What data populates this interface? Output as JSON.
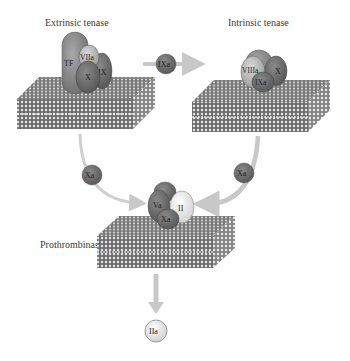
{
  "diagram": {
    "complexes": [
      {
        "id": "extrinsic",
        "label": "Extrinsic tenase",
        "factors": [
          "TF",
          "VIIa",
          "X",
          "IX"
        ]
      },
      {
        "id": "intrinsic",
        "label": "Intrinsic tenase",
        "factors": [
          "VIIIa",
          "X",
          "IXa"
        ]
      },
      {
        "id": "prothrombinase",
        "label": "Prothrombinase",
        "factors": [
          "Va",
          "Xa",
          "II"
        ]
      }
    ],
    "free_molecules": {
      "ixa": "IXa",
      "xa_left": "Xa",
      "xa_right": "Xa",
      "iia": "IIa"
    },
    "factor_labels": {
      "tf": "TF",
      "viia": "VIIa",
      "x_ext": "X",
      "ix": "IX",
      "viiia": "VIIIa",
      "x_int": "X",
      "ixa_int": "IXa",
      "va": "Va",
      "xa_pro": "Xa",
      "ii": "II"
    },
    "colors": {
      "dark_protein": "#6a6a6a",
      "mid_protein": "#8c8c8c",
      "light_protein": "#bdbdbd",
      "white_protein": "#f2f2f2",
      "arrow": "#c8c8c8",
      "membrane": "#7a7a7a"
    }
  }
}
